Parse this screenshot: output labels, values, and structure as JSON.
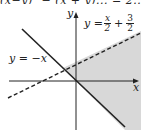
{
  "clipped_header_text": "(x−y)² − (x + y)... = 2... ½(x...",
  "axes": {
    "x_label": "x",
    "y_label": "y"
  },
  "lines": [
    {
      "name": "solid-line",
      "label": "y = −x",
      "style": "solid"
    },
    {
      "name": "dashed-line",
      "label_prefix": "y =",
      "frac1_num": "x",
      "frac1_den": "2",
      "plus": "+",
      "frac2_num": "3",
      "frac2_den": "2",
      "style": "dashed"
    }
  ],
  "colors": {
    "shade": "#d8d8d8",
    "line": "#222222",
    "background": "#ffffff"
  }
}
